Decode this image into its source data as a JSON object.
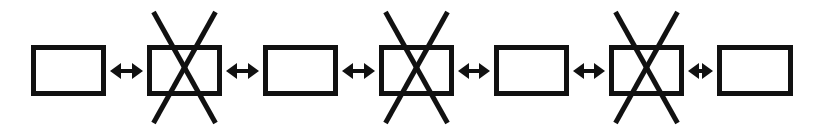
{
  "canvas": {
    "width": 825,
    "height": 135,
    "background_color": "#ffffff",
    "ink_color": "#111111"
  },
  "diagram": {
    "type": "linear-chain",
    "node_count": 7,
    "connector_count": 6,
    "stroke": {
      "box_border_width": 5,
      "cross_line_width": 5,
      "connector_shaft_width": 4
    },
    "nodes": [
      {
        "id": "node-1",
        "shape": "rectangle",
        "icon": "plain-box-icon",
        "crossed": false,
        "x": 31,
        "y": 45,
        "width": 75,
        "height": 51
      },
      {
        "id": "node-2",
        "shape": "rectangle-with-x",
        "icon": "crossed-box-icon",
        "crossed": true,
        "x": 147,
        "y": 45,
        "width": 75,
        "height": 51,
        "cross_top": 12,
        "cross_bottom": 123,
        "cross_half_width": 31
      },
      {
        "id": "node-3",
        "shape": "rectangle",
        "icon": "plain-box-icon",
        "crossed": false,
        "x": 263,
        "y": 45,
        "width": 75,
        "height": 51
      },
      {
        "id": "node-4",
        "shape": "rectangle-with-x",
        "icon": "crossed-box-icon",
        "crossed": true,
        "x": 379,
        "y": 45,
        "width": 75,
        "height": 51,
        "cross_top": 12,
        "cross_bottom": 123,
        "cross_half_width": 31
      },
      {
        "id": "node-5",
        "shape": "rectangle",
        "icon": "plain-box-icon",
        "crossed": false,
        "x": 494,
        "y": 45,
        "width": 75,
        "height": 51
      },
      {
        "id": "node-6",
        "shape": "rectangle-with-x",
        "icon": "crossed-box-icon",
        "crossed": true,
        "x": 609,
        "y": 45,
        "width": 75,
        "height": 51,
        "cross_top": 12,
        "cross_bottom": 123,
        "cross_half_width": 31
      },
      {
        "id": "node-7",
        "shape": "rectangle",
        "icon": "plain-box-icon",
        "crossed": false,
        "x": 717,
        "y": 45,
        "width": 76,
        "height": 51
      }
    ],
    "connectors": [
      {
        "id": "connector-1",
        "icon": "double-arrow-icon",
        "direction": "bidirectional",
        "from": "node-1",
        "to": "node-2",
        "x1": 110,
        "x2": 143,
        "y": 71
      },
      {
        "id": "connector-2",
        "icon": "double-arrow-icon",
        "direction": "bidirectional",
        "from": "node-2",
        "to": "node-3",
        "x1": 226,
        "x2": 259,
        "y": 71
      },
      {
        "id": "connector-3",
        "icon": "double-arrow-icon",
        "direction": "bidirectional",
        "from": "node-3",
        "to": "node-4",
        "x1": 342,
        "x2": 375,
        "y": 71
      },
      {
        "id": "connector-4",
        "icon": "double-arrow-icon",
        "direction": "bidirectional",
        "from": "node-4",
        "to": "node-5",
        "x1": 458,
        "x2": 490,
        "y": 71
      },
      {
        "id": "connector-5",
        "icon": "double-arrow-icon",
        "direction": "bidirectional",
        "from": "node-5",
        "to": "node-6",
        "x1": 573,
        "x2": 605,
        "y": 71
      },
      {
        "id": "connector-6",
        "icon": "double-arrow-icon",
        "direction": "bidirectional",
        "from": "node-6",
        "to": "node-7",
        "x1": 688,
        "x2": 713,
        "y": 71
      }
    ]
  }
}
